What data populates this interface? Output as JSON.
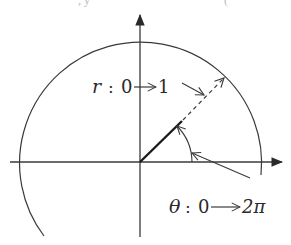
{
  "figure": {
    "top_fragments": [
      ", y",
      "("
    ],
    "labels": {
      "r_label": {
        "variable": "r",
        "colon": ":",
        "from": "0",
        "to": "1"
      },
      "theta_label": {
        "variable": "θ",
        "colon": ":",
        "from": "0",
        "to": "2π"
      }
    },
    "colors": {
      "stroke": "#3a3a3a",
      "text": "#2a2a2a",
      "background": "#ffffff"
    },
    "geometry": {
      "origin": [
        140,
        162
      ],
      "circle_radius": 121,
      "ray_angle_deg": 45
    }
  }
}
